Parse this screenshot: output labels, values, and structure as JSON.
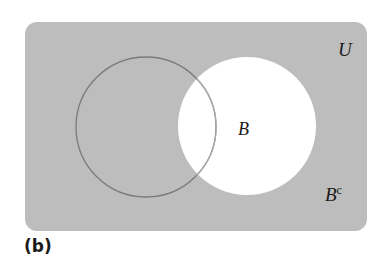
{
  "diagram": {
    "type": "venn",
    "universe": {
      "label": "U",
      "fill": "#bdbdbd"
    },
    "sets": [
      {
        "name": "A",
        "label": "",
        "stroke": "#7a7a7a"
      },
      {
        "name": "B",
        "label": "B",
        "fill": "#ffffff",
        "stroke": "#9a9a9a"
      }
    ],
    "complement_label": {
      "base": "B",
      "superscript": "c"
    },
    "shaded_region": "B complement"
  },
  "caption": "(b)"
}
